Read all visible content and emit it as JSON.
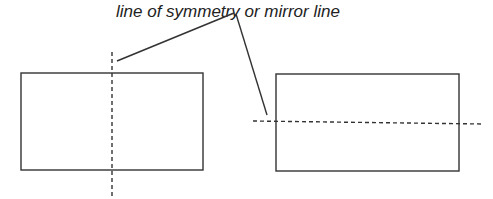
{
  "diagram": {
    "label": "line of symmetry or mirror line",
    "colors": {
      "line": "#333333",
      "background": "#ffffff"
    },
    "shapes": [
      {
        "name": "left-rectangle",
        "symmetry_axis": "vertical"
      },
      {
        "name": "right-rectangle",
        "symmetry_axis": "horizontal"
      }
    ]
  }
}
